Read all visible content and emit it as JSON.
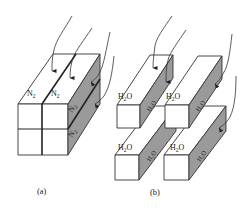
{
  "figure": {
    "panels": [
      {
        "id": "a",
        "caption": "(a)",
        "description": "Single block divided into four channels, nitrogen channels on top and side",
        "labels": {
          "top_left": "N",
          "top_left_sub": "2",
          "top_right": "N",
          "top_right_sub": "2",
          "side_upper": "N",
          "side_upper_sub": "2",
          "side_lower": "N",
          "side_lower_sub": "2"
        }
      },
      {
        "id": "b",
        "caption": "(b)",
        "description": "Four separated bars with water labels on top and side faces",
        "labels": {
          "bar1_top": "H",
          "bar1_top_sub": "2",
          "bar1_top_end": "O",
          "bar1_side": "H₂O",
          "bar2_top": "H",
          "bar2_top_sub": "2",
          "bar2_top_end": "O",
          "bar2_side": "H₂O",
          "bar3_top": "H",
          "bar3_top_sub": "2",
          "bar3_top_end": "O",
          "bar3_side": "H₂O",
          "bar4_top": "H",
          "bar4_top_sub": "2",
          "bar4_top_end": "O",
          "bar4_side": "H₂O"
        }
      }
    ],
    "colors": {
      "shaded_face": "#9a9a9a",
      "outline": "#333333",
      "background": "#ffffff"
    }
  }
}
